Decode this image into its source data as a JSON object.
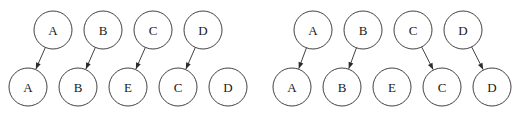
{
  "figure": {
    "type": "diagram",
    "subtype": "bipartite-alignment-graph",
    "background_color": "#ffffff",
    "stroke_color": "#2b2b2b",
    "text_color": "#1a1a1a",
    "node_radius": 19,
    "canvas": {
      "width": 518,
      "height": 116
    },
    "panels": [
      {
        "id": "left",
        "name": "left-diagram",
        "origin_x": 0,
        "top_row": {
          "name": "top-row",
          "y": 30,
          "x_start": 53,
          "x_step": 50,
          "nodes": [
            {
              "id": "t0",
              "label": "A",
              "cx": 53,
              "cy": 30
            },
            {
              "id": "t1",
              "label": "B",
              "cx": 103,
              "cy": 30
            },
            {
              "id": "t2",
              "label": "C",
              "cx": 153,
              "cy": 30
            },
            {
              "id": "t3",
              "label": "D",
              "cx": 203,
              "cy": 30
            }
          ]
        },
        "bottom_row": {
          "name": "bottom-row",
          "y": 87,
          "x_start": 28,
          "x_step": 50,
          "nodes": [
            {
              "id": "b0",
              "label": "A",
              "cx": 28,
              "cy": 87
            },
            {
              "id": "b1",
              "label": "B",
              "cx": 78,
              "cy": 87
            },
            {
              "id": "b2",
              "label": "E",
              "cx": 128,
              "cy": 87
            },
            {
              "id": "b3",
              "label": "C",
              "cx": 178,
              "cy": 87
            },
            {
              "id": "b4",
              "label": "D",
              "cx": 228,
              "cy": 87
            }
          ]
        },
        "edges": [
          {
            "from": "t0",
            "to": "b0",
            "from_label": "A",
            "to_label": "A",
            "direction": "down-left"
          },
          {
            "from": "t1",
            "to": "b1",
            "from_label": "B",
            "to_label": "B",
            "direction": "down-left"
          },
          {
            "from": "t2",
            "to": "b2",
            "from_label": "C",
            "to_label": "E",
            "direction": "down-left"
          },
          {
            "from": "t3",
            "to": "b3",
            "from_label": "D",
            "to_label": "C",
            "direction": "down-left"
          }
        ],
        "unmatched_bottom": [
          "b4"
        ]
      },
      {
        "id": "right",
        "name": "right-diagram",
        "origin_x": 259,
        "top_row": {
          "name": "top-row",
          "y": 30,
          "x_start": 313,
          "x_step": 50,
          "nodes": [
            {
              "id": "t0",
              "label": "A",
              "cx": 313,
              "cy": 30
            },
            {
              "id": "t1",
              "label": "B",
              "cx": 363,
              "cy": 30
            },
            {
              "id": "t2",
              "label": "C",
              "cx": 413,
              "cy": 30
            },
            {
              "id": "t3",
              "label": "D",
              "cx": 463,
              "cy": 30
            }
          ]
        },
        "bottom_row": {
          "name": "bottom-row",
          "y": 87,
          "x_start": 292,
          "x_step": 50,
          "nodes": [
            {
              "id": "b0",
              "label": "A",
              "cx": 292,
              "cy": 87
            },
            {
              "id": "b1",
              "label": "B",
              "cx": 342,
              "cy": 87
            },
            {
              "id": "b2",
              "label": "E",
              "cx": 392,
              "cy": 87
            },
            {
              "id": "b3",
              "label": "C",
              "cx": 442,
              "cy": 87
            },
            {
              "id": "b4",
              "label": "D",
              "cx": 492,
              "cy": 87
            }
          ]
        },
        "edges": [
          {
            "from": "t0",
            "to": "b0",
            "from_label": "A",
            "to_label": "A",
            "direction": "down-left"
          },
          {
            "from": "t1",
            "to": "b1",
            "from_label": "B",
            "to_label": "B",
            "direction": "down-left"
          },
          {
            "from": "t2",
            "to": "b3",
            "from_label": "C",
            "to_label": "C",
            "direction": "down-right"
          },
          {
            "from": "t3",
            "to": "b4",
            "from_label": "D",
            "to_label": "D",
            "direction": "down-right"
          }
        ],
        "unmatched_bottom": [
          "b2"
        ]
      }
    ]
  }
}
